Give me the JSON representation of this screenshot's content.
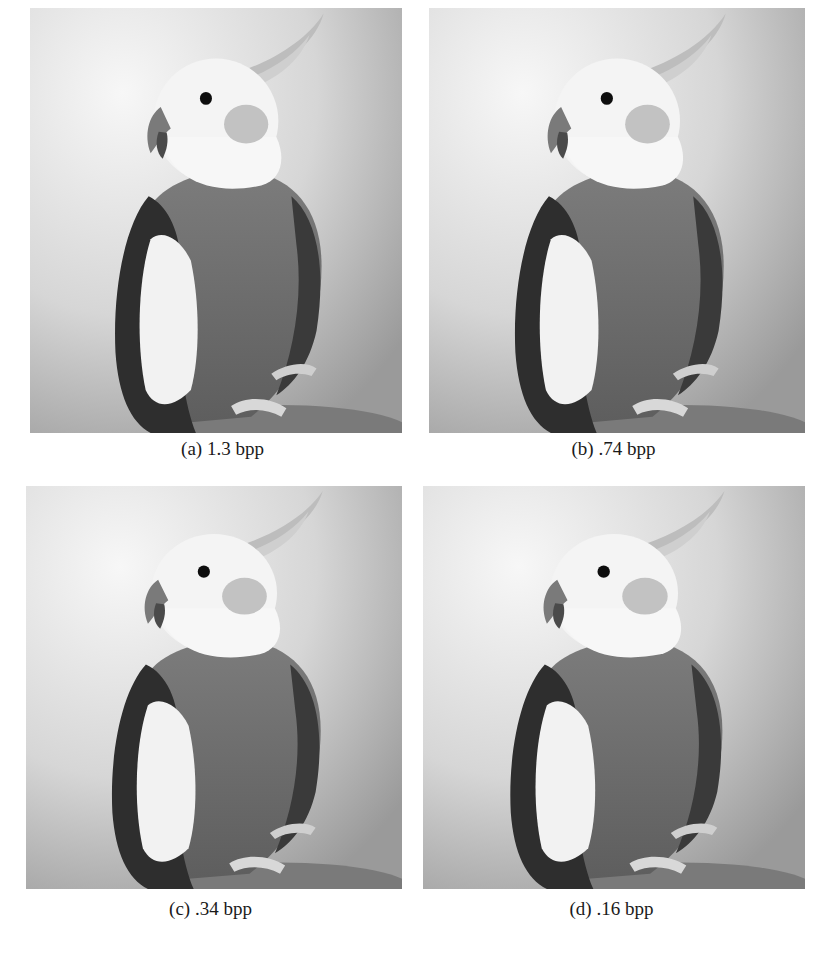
{
  "figure": {
    "panels": [
      {
        "label": "(a)",
        "bitrate": "1.3 bpp",
        "caption": "(a) 1.3 bpp",
        "subject": "cockatiel photograph, grayscale"
      },
      {
        "label": "(b)",
        "bitrate": ".74 bpp",
        "caption": "(b) .74 bpp",
        "subject": "cockatiel photograph, grayscale"
      },
      {
        "label": "(c)",
        "bitrate": ".34 bpp",
        "caption": "(c) .34 bpp",
        "subject": "cockatiel photograph, grayscale"
      },
      {
        "label": "(d)",
        "bitrate": ".16 bpp",
        "caption": "(d) .16 bpp",
        "subject": "cockatiel photograph, grayscale"
      }
    ]
  }
}
